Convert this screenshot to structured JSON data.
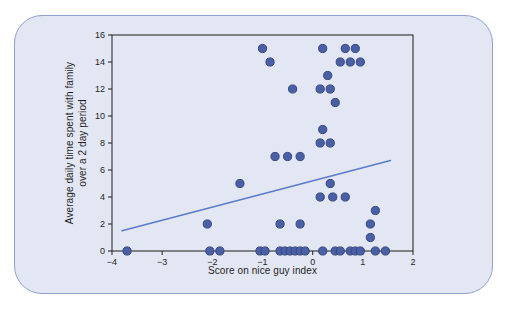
{
  "chart_data": {
    "type": "scatter",
    "title": "",
    "xlabel": "Score on nice guy index",
    "ylabel": "Average daily time spent with family\nover a 2 day period",
    "xlim": [
      -4,
      2
    ],
    "ylim": [
      0,
      16
    ],
    "x_ticks": [
      -4,
      -3,
      -2,
      -1,
      0,
      1,
      2
    ],
    "x_tick_labels": [
      "−4",
      "−3",
      "−2",
      "−1",
      "0",
      "1",
      "2"
    ],
    "y_ticks": [
      0,
      2,
      4,
      6,
      8,
      10,
      12,
      14,
      16
    ],
    "y_tick_labels": [
      "0",
      "2",
      "4",
      "6",
      "8",
      "10",
      "12",
      "14",
      "16"
    ],
    "grid": false,
    "legend": "none",
    "points": [
      [
        -3.7,
        0
      ],
      [
        -2.05,
        0
      ],
      [
        -1.85,
        0
      ],
      [
        -1.05,
        0
      ],
      [
        -0.95,
        0
      ],
      [
        -0.65,
        0
      ],
      [
        -0.55,
        0
      ],
      [
        -0.45,
        0
      ],
      [
        -0.35,
        0
      ],
      [
        -0.25,
        0
      ],
      [
        -0.15,
        0
      ],
      [
        0.2,
        0
      ],
      [
        0.45,
        0
      ],
      [
        0.55,
        0
      ],
      [
        0.75,
        0
      ],
      [
        0.85,
        0
      ],
      [
        0.95,
        0
      ],
      [
        1.25,
        0
      ],
      [
        1.45,
        0
      ],
      [
        1.15,
        1
      ],
      [
        -2.1,
        2
      ],
      [
        -0.65,
        2
      ],
      [
        -0.25,
        2
      ],
      [
        1.15,
        2
      ],
      [
        1.25,
        3
      ],
      [
        0.15,
        4
      ],
      [
        0.4,
        4
      ],
      [
        0.65,
        4
      ],
      [
        -1.45,
        5
      ],
      [
        0.35,
        5
      ],
      [
        -0.75,
        7
      ],
      [
        -0.5,
        7
      ],
      [
        -0.25,
        7
      ],
      [
        0.15,
        8
      ],
      [
        0.35,
        8
      ],
      [
        0.2,
        9
      ],
      [
        0.45,
        11
      ],
      [
        -0.4,
        12
      ],
      [
        0.15,
        12
      ],
      [
        0.35,
        12
      ],
      [
        0.3,
        13
      ],
      [
        -0.85,
        14
      ],
      [
        0.55,
        14
      ],
      [
        0.75,
        14
      ],
      [
        0.95,
        14
      ],
      [
        -1.0,
        15
      ],
      [
        0.2,
        15
      ],
      [
        0.65,
        15
      ],
      [
        0.85,
        15
      ]
    ],
    "trend_line": {
      "x1": -3.8,
      "y1": 1.5,
      "x2": 1.55,
      "y2": 6.7
    },
    "colors": {
      "point_fill": "#4a5fa5",
      "point_edge": "#36477e",
      "trend_line": "#5b7cca",
      "axis": "#2f2f2f",
      "tick_text": "#1f1f1f",
      "panel_bg": "#e2e7f3",
      "panel_border": "#90a1cb"
    }
  }
}
